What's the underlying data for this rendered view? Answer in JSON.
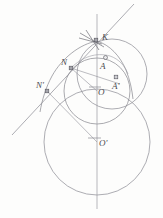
{
  "figure": {
    "kind": "geometry-construction-diagram",
    "caption": "",
    "canvas": {
      "width": 163,
      "height": 218,
      "background": "#fdfdfc"
    },
    "colors": {
      "stroke": "#7c7c84",
      "stroke_light": "#9a9aa2",
      "stroke_dark": "#5f5f67",
      "label": "#4a4a4f",
      "marker_fill": "#a6a6ad",
      "marker_stroke": "#55555d"
    },
    "labels": {
      "K": "K",
      "N": "N",
      "N_prime": "N'",
      "A": "A",
      "A_prime": "A'",
      "O": "O",
      "O_prime": "O'"
    },
    "points": [
      {
        "id": "K",
        "label": "K",
        "x": 97,
        "y": 41,
        "marker": "square"
      },
      {
        "id": "N",
        "label": "N",
        "x": 71,
        "y": 68,
        "marker": "square"
      },
      {
        "id": "Nprime",
        "label": "N'",
        "x": 47,
        "y": 91,
        "marker": "square"
      },
      {
        "id": "A",
        "label": "A",
        "x": 105,
        "y": 59,
        "marker": "circle"
      },
      {
        "id": "Aprime",
        "label": "A'",
        "x": 116,
        "y": 79,
        "marker": "square"
      },
      {
        "id": "O",
        "label": "O",
        "x": 97,
        "y": 91,
        "marker": "tick"
      },
      {
        "id": "Oprime",
        "label": "O'",
        "x": 97,
        "y": 142,
        "marker": "tick"
      }
    ],
    "label_positions": [
      {
        "id": "K",
        "x": 102,
        "y": 36
      },
      {
        "id": "N",
        "x": 62,
        "y": 60
      },
      {
        "id": "Nprime",
        "x": 38,
        "y": 83
      },
      {
        "id": "A",
        "x": 100,
        "y": 62
      },
      {
        "id": "Aprime",
        "x": 112,
        "y": 82
      },
      {
        "id": "O",
        "x": 99,
        "y": 90
      },
      {
        "id": "Oprime",
        "x": 100,
        "y": 140
      }
    ],
    "circles": [
      {
        "id": "circle-O",
        "cx": 97,
        "cy": 91,
        "r": 33,
        "note": "inner circle centred at O"
      },
      {
        "id": "circle-Oprime",
        "cx": 97,
        "cy": 142,
        "r": 53,
        "note": "large circle centred at O-prime"
      },
      {
        "id": "circle-K-Aprime",
        "cx": 112,
        "cy": 74,
        "r": 35,
        "note": "circle through K and A-prime"
      }
    ],
    "lines": [
      {
        "id": "axis-vertical",
        "x1": 97,
        "y1": 14,
        "x2": 97,
        "y2": 209,
        "note": "vertical axis of symmetry through O and O-prime"
      },
      {
        "id": "secant-KN",
        "x1": 133,
        "y1": 5,
        "x2": 13,
        "y2": 134,
        "note": "slanted line through K, N and N-prime"
      },
      {
        "id": "chord-N-Aprime",
        "x1": 71,
        "y1": 68,
        "x2": 119,
        "y2": 83,
        "note": "chord from N toward A-prime side"
      },
      {
        "id": "radius-O-N",
        "x1": 97,
        "y1": 91,
        "x2": 71,
        "y2": 68,
        "note": "radius O to N"
      },
      {
        "id": "radius-Oprime-Nprime",
        "x1": 97,
        "y1": 142,
        "x2": 47,
        "y2": 91,
        "note": "radius O-prime to N-prime"
      },
      {
        "id": "chord-K-O",
        "x1": 97,
        "y1": 41,
        "x2": 97,
        "y2": 91,
        "note": "segment K to O on the axis"
      }
    ],
    "arcs": [
      {
        "id": "arc-K-Nprime",
        "note": "arc from K sweeping left down through N-prime region"
      },
      {
        "id": "arc-K-Aprime",
        "note": "arc from K sweeping right down through A-prime"
      },
      {
        "id": "arc-N-A",
        "note": "small arc from N through A"
      }
    ]
  }
}
